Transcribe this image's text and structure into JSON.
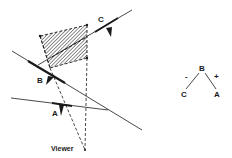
{
  "diagram": {
    "type": "bsp-tree-visibility",
    "colors": {
      "ink": "#1a1a1a",
      "hatch": "#555555",
      "background": "#ffffff"
    },
    "labels": {
      "plane_a": "A",
      "plane_b": "B",
      "plane_c": "C",
      "viewer": "Viewer"
    },
    "tree": {
      "root": "B",
      "left_sign": "-",
      "right_sign": "+",
      "left_child": "C",
      "right_child": "A"
    }
  }
}
